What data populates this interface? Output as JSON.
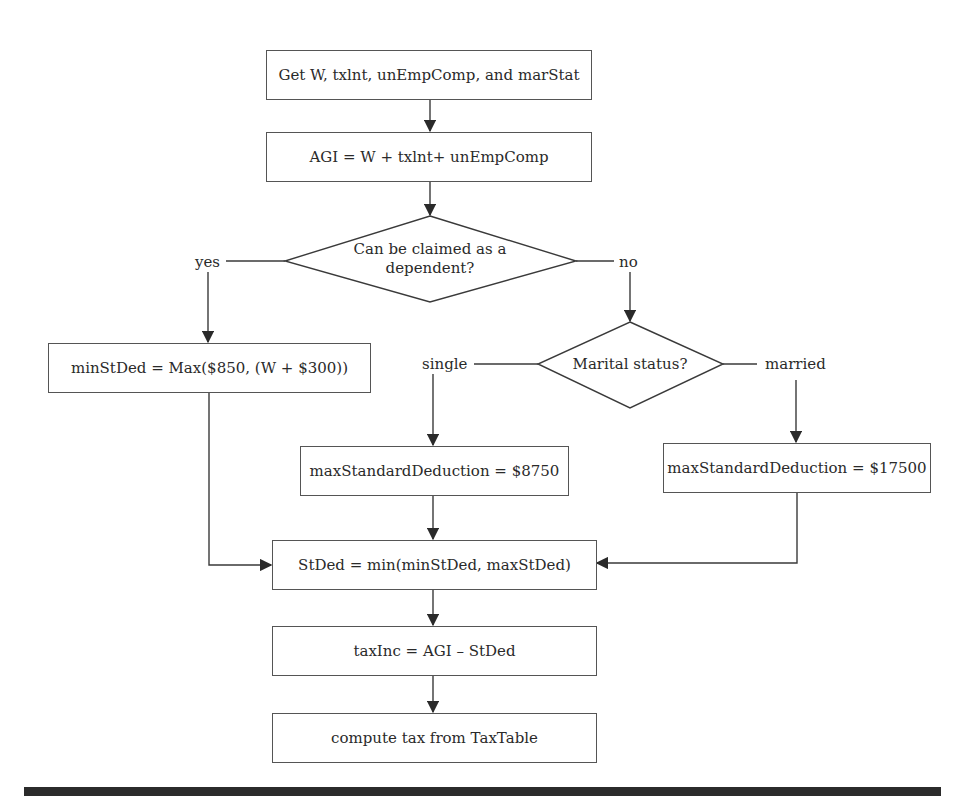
{
  "flowchart": {
    "nodes": {
      "input": {
        "text": "Get W, txlnt, unEmpComp, and marStat"
      },
      "agi": {
        "text": "AGI = W + txlnt+ unEmpComp"
      },
      "dependent_decision": {
        "line1": "Can be claimed as a",
        "line2": "dependent?"
      },
      "min_std_ded": {
        "text": "minStDed = Max($850, (W + $300))"
      },
      "marital_decision": {
        "text": "Marital status?"
      },
      "max_single": {
        "text": "maxStandardDeduction = $8750"
      },
      "max_married": {
        "text": "maxStandardDeduction = $17500"
      },
      "std_ded": {
        "text": "StDed = min(minStDed, maxStDed)"
      },
      "tax_inc": {
        "text": "taxInc = AGI – StDed"
      },
      "compute_tax": {
        "text": "compute tax from TaxTable"
      }
    },
    "edge_labels": {
      "yes": "yes",
      "no": "no",
      "single": "single",
      "married": "married"
    }
  },
  "colors": {
    "line": "#3a3a3a",
    "text": "#2a2a2a",
    "rule": "#2b2b2b"
  }
}
